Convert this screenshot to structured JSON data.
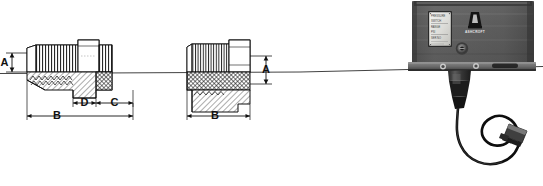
{
  "figure": {
    "background_color": "#ffffff",
    "line_color": "#111111",
    "type": "technical-drawing-with-product-photo"
  },
  "drawing": {
    "left_fitting": {
      "name": "flare-fitting-cross-section",
      "dimensions": [
        {
          "id": "A",
          "label": "A",
          "orientation": "vertical",
          "position": "left"
        },
        {
          "id": "B",
          "label": "B",
          "orientation": "horizontal",
          "position": "bottom"
        },
        {
          "id": "C",
          "label": "C",
          "orientation": "horizontal",
          "position": "middle-right"
        },
        {
          "id": "D",
          "label": "D",
          "orientation": "horizontal",
          "position": "middle-center"
        }
      ]
    },
    "right_fitting": {
      "name": "pipe-plug-cross-section",
      "dimensions": [
        {
          "id": "A",
          "label": "A",
          "orientation": "vertical",
          "position": "right"
        },
        {
          "id": "B",
          "label": "B",
          "orientation": "horizontal",
          "position": "bottom"
        }
      ]
    },
    "centerline": {
      "label": "",
      "style": "thin-solid"
    }
  },
  "device": {
    "name": "pressure-switch",
    "body_color": "#5c5c5c",
    "logo": {
      "mark": "stylized-a-logo",
      "text": "ASHCROFT"
    },
    "nameplate": {
      "lines": [
        "PRESSURE",
        "SWITCH",
        "RANGE",
        "PSI",
        "SER NO"
      ]
    },
    "adjustment_screw": {
      "label": "",
      "name": "adjustment-screw"
    },
    "cable": {
      "label": "",
      "name": "capillary-cable"
    },
    "connector": {
      "label": "",
      "name": "cable-connector"
    }
  }
}
